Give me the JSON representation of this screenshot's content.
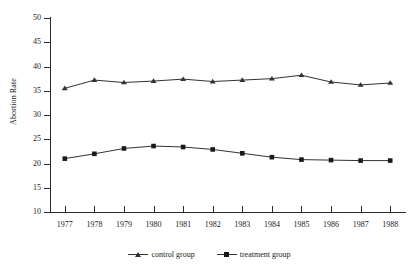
{
  "chart_data": {
    "type": "line",
    "title": "",
    "xlabel": "",
    "ylabel": "Abortion Rate",
    "categories": [
      "1977",
      "1978",
      "1979",
      "1980",
      "1981",
      "1982",
      "1983",
      "1984",
      "1985",
      "1986",
      "1987",
      "1988"
    ],
    "x": [
      1977,
      1978,
      1979,
      1980,
      1981,
      1982,
      1983,
      1984,
      1985,
      1986,
      1987,
      1988
    ],
    "ylim": [
      10,
      50
    ],
    "yticks": [
      10,
      15,
      20,
      25,
      30,
      35,
      40,
      45,
      50
    ],
    "ytick_labels": [
      "10",
      "15",
      "20",
      "25",
      "30",
      "35",
      "40",
      "45",
      "50"
    ],
    "grid": false,
    "legend_position": "bottom-center",
    "series": [
      {
        "name": "control group",
        "marker": "triangle",
        "color": "#333333",
        "values": [
          35.5,
          37.2,
          36.7,
          37.0,
          37.4,
          36.9,
          37.2,
          37.5,
          38.2,
          36.8,
          36.2,
          36.6
        ]
      },
      {
        "name": "treatment group",
        "marker": "square",
        "color": "#1a1a1a",
        "values": [
          21.0,
          22.0,
          23.1,
          23.6,
          23.4,
          22.9,
          22.1,
          21.3,
          20.8,
          20.7,
          20.6,
          20.6
        ]
      }
    ]
  },
  "axis": {
    "y_title": "Abortion Rate"
  },
  "legend": {
    "entries": [
      {
        "label": "control group"
      },
      {
        "label": "treatment group"
      }
    ]
  }
}
